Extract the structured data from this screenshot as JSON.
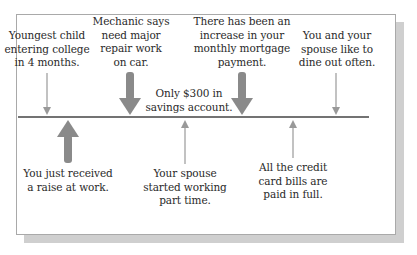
{
  "diagram": {
    "type": "timeline-force-field",
    "colors": {
      "line": "#444444",
      "thick_arrow": "#8a8a8a",
      "thin_arrow": "#999999",
      "frame_border": "#a9a9a9",
      "shadow": "#cfcfcf",
      "text": "#2a2a2a"
    },
    "above": [
      {
        "id": "youngest-child",
        "lines": [
          "Youngest child",
          "entering college",
          "in 4 months."
        ],
        "arrow": "thin-down"
      },
      {
        "id": "mechanic",
        "lines": [
          "Mechanic says",
          "need major",
          "repair work",
          "on car."
        ],
        "arrow": "thick-down"
      },
      {
        "id": "savings",
        "lines": [
          "Only $300 in",
          "savings account."
        ],
        "arrow": "none"
      },
      {
        "id": "mortgage",
        "lines": [
          "There has been an",
          "increase in your",
          "monthly mortgage",
          "payment."
        ],
        "arrow": "thick-down"
      },
      {
        "id": "dine-out",
        "lines": [
          "You and your",
          "spouse like to",
          "dine out often."
        ],
        "arrow": "thin-down"
      }
    ],
    "below": [
      {
        "id": "raise",
        "lines": [
          "You just received",
          "a raise at work."
        ],
        "arrow": "thick-up"
      },
      {
        "id": "spouse-working",
        "lines": [
          "Your spouse",
          "started working",
          "part time."
        ],
        "arrow": "thin-up"
      },
      {
        "id": "credit-cards",
        "lines": [
          "All the credit",
          "card bills are",
          "paid in full."
        ],
        "arrow": "thin-up"
      }
    ]
  }
}
